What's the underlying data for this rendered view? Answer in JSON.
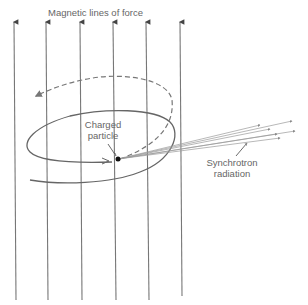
{
  "title": "Magnetic lines of force",
  "labels": {
    "field_lines": "Magnetic lines of force",
    "particle_line1": "Charged",
    "particle_line2": "particle",
    "radiation_line1": "Synchrotron",
    "radiation_line2": "radiation"
  },
  "colors": {
    "lines": "#777777",
    "orbit": "#666666",
    "particle": "#111111",
    "text": "#666666"
  },
  "field_line_x": [
    14,
    46,
    80,
    113,
    146,
    180
  ]
}
